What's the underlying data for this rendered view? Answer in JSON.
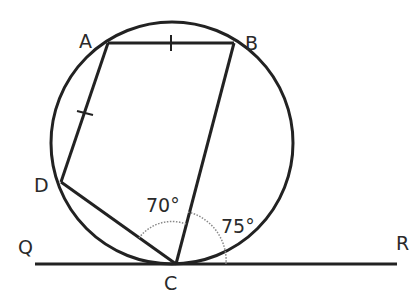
{
  "diagram": {
    "type": "cyclic-quadrilateral-with-tangent",
    "circle": {
      "cx": 172,
      "cy": 143,
      "r": 121
    },
    "points": {
      "A": {
        "label": "A",
        "x": 108,
        "y": 43
      },
      "B": {
        "label": "B",
        "x": 234,
        "y": 43
      },
      "C": {
        "label": "C",
        "x": 176,
        "y": 264
      },
      "D": {
        "label": "D",
        "x": 61,
        "y": 182
      },
      "Q": {
        "label": "Q",
        "x": 35,
        "y": 264
      },
      "R": {
        "label": "R",
        "x": 397,
        "y": 264
      }
    },
    "labels": {
      "A": "A",
      "B": "B",
      "C": "C",
      "D": "D",
      "Q": "Q",
      "R": "R"
    },
    "angles": {
      "DCB": "70°",
      "BCR": "75°"
    },
    "equal_marks": [
      "AB",
      "AD"
    ],
    "colors": {
      "stroke": "#222222",
      "arc": "#888888",
      "text": "#2a2a2a"
    }
  }
}
